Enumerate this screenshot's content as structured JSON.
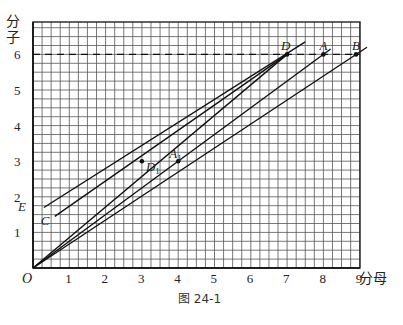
{
  "figure": {
    "caption": "图 24-1",
    "x_axis_label": "分母",
    "y_axis_label_top": "分",
    "y_axis_label_bottom": "子",
    "origin_label": "O"
  },
  "axes": {
    "x_ticks": [
      "1",
      "2",
      "3",
      "4",
      "5",
      "6",
      "7",
      "8",
      "9"
    ],
    "y_ticks": [
      "1",
      "2",
      "3",
      "4",
      "5",
      "6"
    ],
    "x_range": [
      0,
      9.25
    ],
    "y_range": [
      0,
      6.9
    ],
    "minor_divisions_per_unit": 4
  },
  "reference_line": {
    "y": 6,
    "style": "dashed"
  },
  "points": [
    {
      "name": "D",
      "label": "D",
      "x": 7,
      "y": 6
    },
    {
      "name": "A",
      "label": "A",
      "x": 8,
      "y": 6
    },
    {
      "name": "B",
      "label": "B",
      "x": 8.9,
      "y": 6
    },
    {
      "name": "D1",
      "label": "D",
      "sub": "1",
      "x": 3,
      "y": 3
    },
    {
      "name": "A1",
      "label": "A",
      "sub": "1",
      "x": 4,
      "y": 3
    },
    {
      "name": "E",
      "label": "E",
      "x": 0.3,
      "y": 1.7
    },
    {
      "name": "C",
      "label": "C",
      "x": 0.6,
      "y": 1.45
    }
  ],
  "lines": [
    {
      "name": "line-OB",
      "from": [
        0,
        0
      ],
      "to": [
        9.2,
        6.2
      ]
    },
    {
      "name": "line-OA",
      "from": [
        0,
        0
      ],
      "to": [
        8.2,
        6.15
      ]
    },
    {
      "name": "line-CD",
      "from": [
        0.6,
        1.45
      ],
      "to": [
        7.0,
        6.0
      ]
    },
    {
      "name": "line-ED",
      "from": [
        0.3,
        1.7
      ],
      "to": [
        7.5,
        6.35
      ]
    },
    {
      "name": "line-OD",
      "from": [
        0,
        0
      ],
      "to": [
        7.0,
        6.0
      ]
    }
  ]
}
